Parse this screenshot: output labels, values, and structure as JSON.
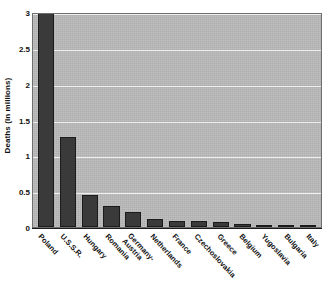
{
  "chart_data": {
    "type": "bar",
    "title": "",
    "xlabel": "",
    "ylabel": "Deaths (in millions)",
    "ylim": [
      0,
      3
    ],
    "yticks": [
      "0",
      "0.5",
      "1",
      "1.5",
      "2",
      "2.5",
      "3"
    ],
    "ytick_values": [
      0,
      0.5,
      1,
      1.5,
      2,
      2.5,
      3
    ],
    "grid": true,
    "legend": "none",
    "categories": [
      "Poland",
      "U.S.S.R.",
      "Hungary",
      "Romania",
      "Germany-\nAustria",
      "Netherlands",
      "France",
      "Czechoslovakia",
      "Greece",
      "Belgium",
      "Yugoslavia",
      "Bulgaria",
      "Italy"
    ],
    "values": [
      3.0,
      1.25,
      0.45,
      0.3,
      0.21,
      0.105,
      0.09,
      0.085,
      0.065,
      0.045,
      0.03,
      0.02,
      0.015
    ],
    "colors": {
      "bar_fill": "#3a3a3a",
      "bar_edge": "#1b1b1b",
      "plot_background": "#b9b9b9",
      "gridline": "#efefef",
      "axis": "#1c1c1c",
      "text": "#111111",
      "page_background": "#ffffff"
    }
  }
}
